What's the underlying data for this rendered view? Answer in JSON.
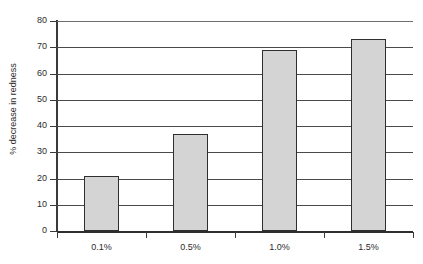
{
  "header": {
    "cropped_text": "— —— ——— — —— ——— — ——"
  },
  "chart_data": {
    "type": "bar",
    "title": "",
    "subtitle": "",
    "xlabel": "",
    "ylabel": "% decrease in redness",
    "categories": [
      "0.1%",
      "0.5%",
      "1.0%",
      "1.5%"
    ],
    "values": [
      21,
      37,
      69,
      73
    ],
    "series": [
      {
        "name": "% decrease in redness",
        "values": [
          21,
          37,
          69,
          73
        ]
      }
    ],
    "ylim": [
      0,
      80
    ],
    "y_ticks": [
      0,
      10,
      20,
      30,
      40,
      50,
      60,
      70,
      80
    ],
    "y_tick_labels": [
      "0",
      "10",
      "20",
      "30",
      "40",
      "50",
      "60",
      "70",
      "80"
    ],
    "grid": true,
    "grid_axis": "y",
    "legend": false,
    "legend_position": "none",
    "bar_fill_color": "#d4d4d4",
    "bar_border_color": "#2f2f2f",
    "axis_color": "#3a3a3a",
    "background_color": "#ffffff",
    "annotations": []
  }
}
